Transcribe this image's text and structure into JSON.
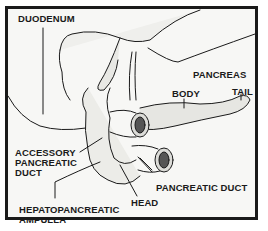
{
  "diagram": {
    "labels": {
      "duodenum": "DUODENUM",
      "pancreas": "PANCREAS",
      "body": "BODY",
      "tail": "TAIL",
      "accessory_duct_line1": "ACCESSORY",
      "accessory_duct_line2": "PANCREATIC",
      "accessory_duct_line3": "DUCT",
      "pancreatic_duct": "PANCREATIC DUCT",
      "head": "HEAD",
      "ampulla_line1": "HEPATOPANCREATIC",
      "ampulla_line2": "AMPULLA"
    },
    "colors": {
      "ink": "#1a1a1a",
      "background": "#f7f7f5"
    }
  }
}
